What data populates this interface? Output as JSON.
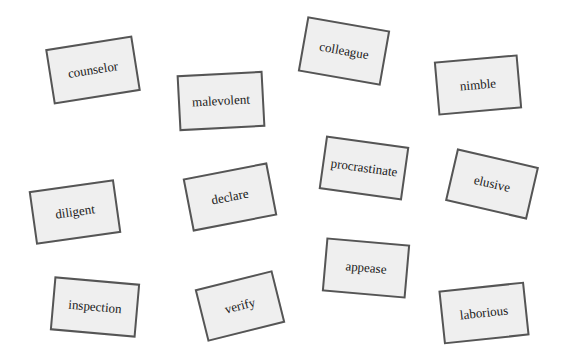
{
  "canvas": {
    "width": 564,
    "height": 356,
    "background": "#ffffff"
  },
  "style": {
    "card_fill": "#efefef",
    "card_border": "#555555",
    "text_color": "#1a1a1a"
  },
  "cards": [
    {
      "label": "counselor",
      "cx": 93,
      "cy": 70,
      "w": 88,
      "h": 56,
      "rotate": -9
    },
    {
      "label": "malevolent",
      "cx": 221,
      "cy": 101,
      "w": 86,
      "h": 56,
      "rotate": -3
    },
    {
      "label": "colleague",
      "cx": 344,
      "cy": 51,
      "w": 84,
      "h": 56,
      "rotate": 10
    },
    {
      "label": "nimble",
      "cx": 478,
      "cy": 85,
      "w": 84,
      "h": 54,
      "rotate": -5
    },
    {
      "label": "procrastinate",
      "cx": 364,
      "cy": 168,
      "w": 84,
      "h": 54,
      "rotate": 8
    },
    {
      "label": "elusive",
      "cx": 492,
      "cy": 184,
      "w": 84,
      "h": 54,
      "rotate": 13
    },
    {
      "label": "diligent",
      "cx": 75,
      "cy": 212,
      "w": 86,
      "h": 54,
      "rotate": -8
    },
    {
      "label": "declare",
      "cx": 230,
      "cy": 197,
      "w": 86,
      "h": 54,
      "rotate": -11
    },
    {
      "label": "appease",
      "cx": 366,
      "cy": 268,
      "w": 84,
      "h": 54,
      "rotate": 5
    },
    {
      "label": "inspection",
      "cx": 95,
      "cy": 307,
      "w": 86,
      "h": 54,
      "rotate": 5
    },
    {
      "label": "verify",
      "cx": 240,
      "cy": 306,
      "w": 80,
      "h": 54,
      "rotate": -14
    },
    {
      "label": "laborious",
      "cx": 484,
      "cy": 313,
      "w": 86,
      "h": 54,
      "rotate": -6
    }
  ]
}
